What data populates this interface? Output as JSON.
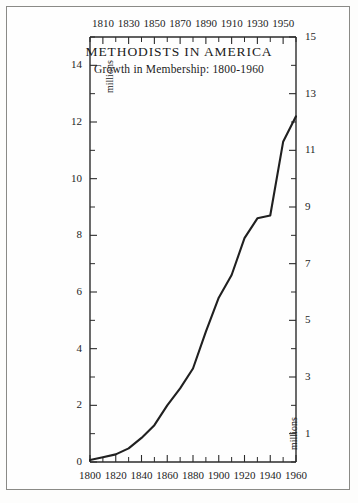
{
  "figure": {
    "border_color": "#8a8a86",
    "background": "#fefefe"
  },
  "chart_data": {
    "type": "line",
    "title": "METHODISTS IN AMERICA",
    "subtitle": "Growth in Membership: 1800-1960",
    "xlabel": "",
    "ylabel": "millions",
    "ylabel_right": "millions",
    "xlim": [
      1800,
      1960
    ],
    "ylim": [
      0,
      15
    ],
    "grid": false,
    "legend": "none",
    "x_tick_labels_bottom": [
      "1800",
      "1820",
      "1840",
      "1860",
      "1880",
      "1900",
      "1920",
      "1940",
      "1960"
    ],
    "x_tick_values_bottom": [
      1800,
      1820,
      1840,
      1860,
      1880,
      1900,
      1920,
      1940,
      1960
    ],
    "x_tick_labels_top": [
      "1810",
      "1830",
      "1850",
      "1870",
      "1890",
      "1910",
      "1930",
      "1950"
    ],
    "x_tick_values_top": [
      1810,
      1830,
      1850,
      1870,
      1890,
      1910,
      1930,
      1950
    ],
    "x_minor_ticks": [
      1800,
      1810,
      1820,
      1830,
      1840,
      1850,
      1860,
      1870,
      1880,
      1890,
      1900,
      1910,
      1920,
      1930,
      1940,
      1950,
      1960
    ],
    "y_tick_labels_left": [
      "0",
      "2",
      "4",
      "6",
      "8",
      "10",
      "12",
      "14"
    ],
    "y_tick_values_left": [
      0,
      2,
      4,
      6,
      8,
      10,
      12,
      14
    ],
    "y_tick_labels_right": [
      "1",
      "3",
      "5",
      "7",
      "9",
      "11",
      "13",
      "15"
    ],
    "y_tick_values_right": [
      1,
      3,
      5,
      7,
      9,
      11,
      13,
      15
    ],
    "y_minor_ticks": [
      0,
      1,
      2,
      3,
      4,
      5,
      6,
      7,
      8,
      9,
      10,
      11,
      12,
      13,
      14,
      15
    ],
    "series": [
      {
        "name": "Methodist membership",
        "color": "#202020",
        "x": [
          1800,
          1810,
          1820,
          1830,
          1840,
          1850,
          1860,
          1870,
          1880,
          1890,
          1900,
          1910,
          1920,
          1930,
          1940,
          1950,
          1960
        ],
        "values": [
          0.07,
          0.17,
          0.27,
          0.48,
          0.85,
          1.3,
          2.0,
          2.6,
          3.3,
          4.6,
          5.8,
          6.6,
          7.9,
          8.6,
          8.7,
          11.3,
          12.2
        ]
      }
    ]
  }
}
